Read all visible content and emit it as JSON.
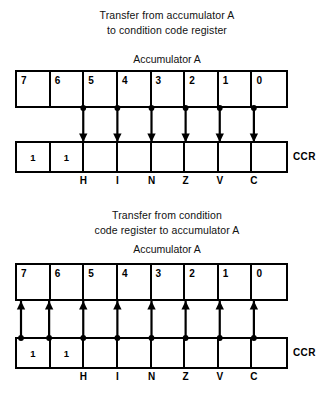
{
  "diagram": {
    "type": "register-transfer-diagram",
    "background_color": "#ffffff",
    "line_color": "#000000",
    "panels": [
      {
        "id": "accumulator-to-ccr",
        "title_lines": [
          "Transfer from accumulator A",
          "to condition code register"
        ],
        "top_register": {
          "label": "Accumulator A",
          "cells": [
            {
              "bit": "7",
              "value": ""
            },
            {
              "bit": "6",
              "value": ""
            },
            {
              "bit": "5",
              "value": ""
            },
            {
              "bit": "4",
              "value": ""
            },
            {
              "bit": "3",
              "value": ""
            },
            {
              "bit": "2",
              "value": ""
            },
            {
              "bit": "1",
              "value": ""
            },
            {
              "bit": "0",
              "value": ""
            }
          ]
        },
        "bottom_register": {
          "label": "CCR",
          "cells": [
            {
              "value": "1"
            },
            {
              "value": "1"
            },
            {
              "value": ""
            },
            {
              "value": ""
            },
            {
              "value": ""
            },
            {
              "value": ""
            },
            {
              "value": ""
            },
            {
              "value": ""
            }
          ]
        },
        "flags": [
          "H",
          "I",
          "N",
          "Z",
          "V",
          "C"
        ],
        "arrow_direction": "down",
        "arrow_count": 6
      },
      {
        "id": "ccr-to-accumulator",
        "title_lines": [
          "Transfer from condition",
          "code register to accumulator A"
        ],
        "top_register": {
          "label": "Accumulator A",
          "cells": [
            {
              "bit": "7",
              "value": ""
            },
            {
              "bit": "6",
              "value": ""
            },
            {
              "bit": "5",
              "value": ""
            },
            {
              "bit": "4",
              "value": ""
            },
            {
              "bit": "3",
              "value": ""
            },
            {
              "bit": "2",
              "value": ""
            },
            {
              "bit": "1",
              "value": ""
            },
            {
              "bit": "0",
              "value": ""
            }
          ]
        },
        "bottom_register": {
          "label": "CCR",
          "cells": [
            {
              "value": "1"
            },
            {
              "value": "1"
            },
            {
              "value": ""
            },
            {
              "value": ""
            },
            {
              "value": ""
            },
            {
              "value": ""
            },
            {
              "value": ""
            },
            {
              "value": ""
            }
          ]
        },
        "flags": [
          "H",
          "I",
          "N",
          "Z",
          "V",
          "C"
        ],
        "arrow_direction": "up",
        "arrow_count": 8
      }
    ]
  }
}
